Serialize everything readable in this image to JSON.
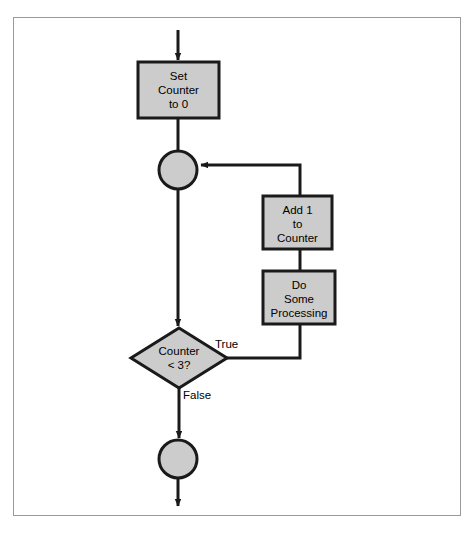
{
  "diagram": {
    "type": "flowchart",
    "colors": {
      "shape_fill": "#cccccc",
      "shape_stroke": "#1a1a1a",
      "connector": "#1a1a1a",
      "frame_border": "#9a9a9a",
      "background": "#ffffff",
      "text": "#000000"
    },
    "nodes": [
      {
        "id": "start-arrow",
        "kind": "entry-arrow",
        "label": ""
      },
      {
        "id": "set-counter",
        "kind": "process",
        "label": "Set\nCounter\nto 0"
      },
      {
        "id": "loop-junction",
        "kind": "connector-circle",
        "label": ""
      },
      {
        "id": "add-one",
        "kind": "process",
        "label": "Add 1\nto\nCounter"
      },
      {
        "id": "do-processing",
        "kind": "process",
        "label": "Do\nSome\nProcessing"
      },
      {
        "id": "counter-check",
        "kind": "decision",
        "label": "Counter\n< 3?"
      },
      {
        "id": "end-node",
        "kind": "connector-circle",
        "label": ""
      }
    ],
    "edges": [
      {
        "id": "edge-entry",
        "from": "start-arrow",
        "to": "set-counter",
        "label": ""
      },
      {
        "id": "edge-set-to-junction",
        "from": "set-counter",
        "to": "loop-junction",
        "label": ""
      },
      {
        "id": "edge-junction-to-decision",
        "from": "loop-junction",
        "to": "counter-check",
        "label": ""
      },
      {
        "id": "edge-true",
        "from": "counter-check",
        "to": "do-processing",
        "label": "True"
      },
      {
        "id": "edge-processing-to-add",
        "from": "do-processing",
        "to": "add-one",
        "label": ""
      },
      {
        "id": "edge-add-to-junction",
        "from": "add-one",
        "to": "loop-junction",
        "label": ""
      },
      {
        "id": "edge-false",
        "from": "counter-check",
        "to": "end-node",
        "label": "False"
      },
      {
        "id": "edge-exit",
        "from": "end-node",
        "to": "",
        "label": ""
      }
    ]
  }
}
